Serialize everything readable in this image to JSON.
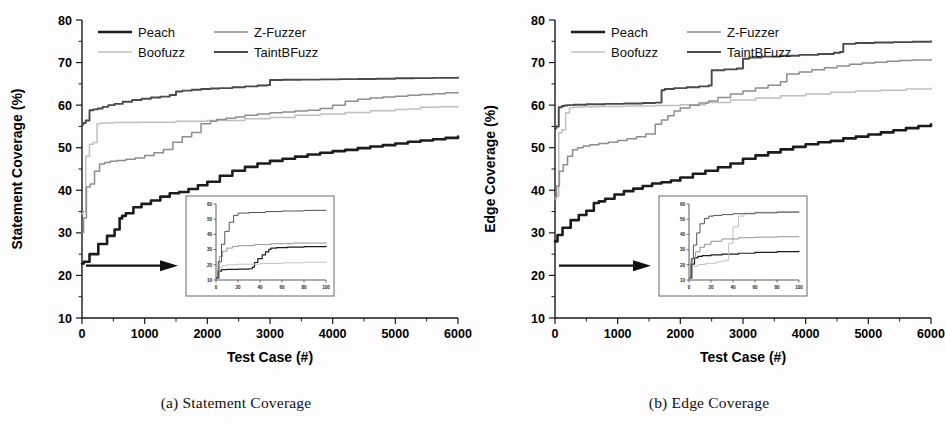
{
  "figure": {
    "panels": [
      {
        "id": "a",
        "caption": "(a) Statement Coverage",
        "ylabel": "Statement Coverage (%)",
        "xlabel": "Test Case (#)"
      },
      {
        "id": "b",
        "caption": "(b) Edge Coverage",
        "ylabel": "Edge Coverage (%)",
        "xlabel": "Test Case (#)"
      }
    ],
    "legend": {
      "entries": [
        {
          "label": "Peach",
          "color": "#1c1c1c",
          "width": 2.6
        },
        {
          "label": "Z-Fuzzer",
          "color": "#8e8e8e",
          "width": 1.5
        },
        {
          "label": "Boofuzz",
          "color": "#c0c0c0",
          "width": 1.5
        },
        {
          "label": "TaintBFuzz",
          "color": "#4a4a4a",
          "width": 1.9
        }
      ]
    }
  },
  "chart_data": [
    {
      "type": "line",
      "title": "(a) Statement Coverage",
      "xlabel": "Test Case (#)",
      "ylabel": "Statement Coverage (%)",
      "xlim": [
        0,
        6000
      ],
      "ylim": [
        10,
        80
      ],
      "xticks": [
        0,
        1000,
        2000,
        3000,
        4000,
        5000,
        6000
      ],
      "yticks": [
        10,
        20,
        30,
        40,
        50,
        60,
        70,
        80
      ],
      "grid": false,
      "legend_position": "top-left-inside",
      "annotations": [
        "arrow from y-axis near 22% pointing right to inset"
      ],
      "series": [
        {
          "name": "Peach",
          "color": "#1c1c1c",
          "x": [
            0,
            30,
            120,
            260,
            400,
            520,
            600,
            640,
            700,
            820,
            950,
            1100,
            1250,
            1400,
            1550,
            1700,
            1850,
            2000,
            2200,
            2400,
            2600,
            2800,
            3000,
            3200,
            3400,
            3600,
            3800,
            4000,
            4200,
            4400,
            4600,
            4800,
            5000,
            5200,
            5400,
            5600,
            5800,
            6000
          ],
          "y": [
            22.8,
            23.2,
            25.0,
            27.4,
            29.3,
            30.8,
            33.4,
            34.0,
            34.6,
            36.0,
            36.8,
            37.6,
            38.5,
            39.3,
            39.6,
            40.3,
            41.2,
            42.0,
            43.4,
            44.6,
            45.5,
            46.3,
            46.9,
            47.4,
            47.9,
            48.4,
            48.8,
            49.2,
            49.5,
            49.9,
            50.3,
            50.6,
            51.0,
            51.4,
            51.7,
            52.0,
            52.3,
            52.6
          ]
        },
        {
          "name": "Boofuzz",
          "color": "#c0c0c0",
          "x": [
            0,
            20,
            60,
            120,
            180,
            240,
            300,
            500,
            900,
            1500,
            2000,
            2600,
            3000,
            3400,
            3800,
            4200,
            4600,
            5000,
            5200,
            5400,
            5700,
            6000
          ],
          "y": [
            34.5,
            35.0,
            48.0,
            50.8,
            51.2,
            55.6,
            55.8,
            55.9,
            56.0,
            56.2,
            56.4,
            56.8,
            57.1,
            57.6,
            57.9,
            58.3,
            58.7,
            59.0,
            59.1,
            59.5,
            59.6,
            59.7
          ]
        },
        {
          "name": "Z-Fuzzer",
          "color": "#8e8e8e",
          "x": [
            0,
            25,
            70,
            130,
            200,
            280,
            360,
            450,
            560,
            700,
            850,
            1000,
            1150,
            1300,
            1450,
            1600,
            1750,
            1900,
            2050,
            2150,
            2300,
            2450,
            2600,
            2800,
            3000,
            3200,
            3400,
            3600,
            3800,
            4000,
            4200,
            4400,
            4600,
            4800,
            5000,
            5200,
            5400,
            5600,
            5800,
            6000
          ],
          "y": [
            30.0,
            33.5,
            40.8,
            41.5,
            44.5,
            46.2,
            46.5,
            46.8,
            47.0,
            47.3,
            47.6,
            48.2,
            48.8,
            49.6,
            51.3,
            52.6,
            53.6,
            55.6,
            56.2,
            56.6,
            56.9,
            57.2,
            57.6,
            57.9,
            58.2,
            58.4,
            58.6,
            58.8,
            59.2,
            60.0,
            60.9,
            61.4,
            61.7,
            61.9,
            62.1,
            62.3,
            62.5,
            62.7,
            62.9,
            63.0
          ]
        },
        {
          "name": "TaintBFuzz",
          "color": "#4a4a4a",
          "x": [
            0,
            20,
            60,
            120,
            180,
            250,
            330,
            420,
            520,
            650,
            800,
            950,
            1100,
            1250,
            1400,
            1500,
            1600,
            1750,
            1900,
            2050,
            2200,
            2400,
            2600,
            2800,
            2950,
            3000,
            3200,
            3500,
            3800,
            4100,
            4400,
            4700,
            5000,
            5300,
            5600,
            6000
          ],
          "y": [
            55.4,
            55.8,
            56.4,
            58.8,
            59.0,
            59.2,
            59.6,
            60.0,
            60.3,
            60.8,
            61.2,
            61.5,
            61.8,
            62.0,
            62.4,
            63.2,
            63.4,
            63.6,
            63.8,
            63.9,
            64.0,
            64.2,
            64.4,
            64.6,
            64.7,
            65.9,
            65.95,
            66.0,
            66.05,
            66.1,
            66.15,
            66.2,
            66.3,
            66.35,
            66.4,
            66.5
          ]
        }
      ],
      "inset": {
        "xlim": [
          0,
          100
        ],
        "ylim": [
          10,
          60
        ],
        "xticks": [
          0,
          20,
          40,
          60,
          80,
          100
        ],
        "yticks": [
          10,
          20,
          30,
          40,
          50,
          60
        ],
        "series": [
          {
            "name": "Peach",
            "color": "#1c1c1c",
            "x": [
              0,
              2,
              5,
              10,
              20,
              30,
              33,
              35,
              38,
              42,
              45,
              48,
              50,
              55,
              65,
              80,
              100
            ],
            "y": [
              11.5,
              15.8,
              16.8,
              17.0,
              17.2,
              17.4,
              18.5,
              21.5,
              24.0,
              26.5,
              28.5,
              30.2,
              31.0,
              31.3,
              31.6,
              32.0,
              32.5
            ]
          },
          {
            "name": "Boofuzz",
            "color": "#c0c0c0",
            "x": [
              0,
              3,
              6,
              10,
              20,
              40,
              60,
              80,
              100
            ],
            "y": [
              11.0,
              18.5,
              19.6,
              20.0,
              20.4,
              20.9,
              21.3,
              21.7,
              22.1
            ]
          },
          {
            "name": "Z-Fuzzer",
            "color": "#8e8e8e",
            "x": [
              0,
              3,
              6,
              10,
              15,
              20,
              35,
              50,
              70,
              100
            ],
            "y": [
              11.0,
              25.5,
              29.0,
              31.0,
              32.0,
              32.6,
              33.3,
              33.9,
              34.3,
              34.8
            ]
          },
          {
            "name": "TaintBFuzz",
            "color": "#4a4a4a",
            "x": [
              0,
              2,
              5,
              8,
              12,
              16,
              20,
              30,
              45,
              60,
              80,
              100
            ],
            "y": [
              11.5,
              22.0,
              33.5,
              42.0,
              48.0,
              52.5,
              54.0,
              54.4,
              55.0,
              55.4,
              55.8,
              56.2
            ]
          }
        ]
      }
    },
    {
      "type": "line",
      "title": "(b) Edge Coverage",
      "xlabel": "Test Case (#)",
      "ylabel": "Edge Coverage (%)",
      "xlim": [
        0,
        6000
      ],
      "ylim": [
        10,
        80
      ],
      "xticks": [
        0,
        1000,
        2000,
        3000,
        4000,
        5000,
        6000
      ],
      "yticks": [
        10,
        20,
        30,
        40,
        50,
        60,
        70,
        80
      ],
      "grid": false,
      "legend_position": "top-left-inside",
      "annotations": [
        "arrow from y-axis near 22% pointing right to inset"
      ],
      "series": [
        {
          "name": "Peach",
          "color": "#1c1c1c",
          "x": [
            0,
            40,
            120,
            250,
            380,
            500,
            620,
            700,
            800,
            950,
            1100,
            1250,
            1400,
            1550,
            1700,
            1850,
            2000,
            2200,
            2400,
            2600,
            2800,
            3000,
            3200,
            3400,
            3600,
            3800,
            4000,
            4200,
            4400,
            4600,
            4800,
            5000,
            5200,
            5400,
            5600,
            5800,
            6000
          ],
          "y": [
            28.0,
            29.5,
            31.2,
            33.0,
            34.2,
            35.2,
            37.0,
            37.4,
            38.0,
            39.0,
            39.8,
            40.4,
            41.0,
            41.6,
            41.9,
            42.3,
            43.0,
            43.9,
            44.6,
            45.4,
            46.3,
            47.4,
            48.2,
            48.9,
            49.6,
            50.2,
            50.8,
            51.3,
            51.6,
            52.2,
            52.6,
            53.1,
            53.6,
            54.1,
            54.6,
            55.1,
            55.5
          ]
        },
        {
          "name": "Boofuzz",
          "color": "#c0c0c0",
          "x": [
            0,
            20,
            60,
            110,
            170,
            230,
            300,
            450,
            700,
            1100,
            1600,
            2000,
            2400,
            2800,
            3200,
            3600,
            4000,
            4400,
            4800,
            5200,
            5600,
            6000
          ],
          "y": [
            38.0,
            38.6,
            53.5,
            54.2,
            58.2,
            59.4,
            59.5,
            59.6,
            59.7,
            59.8,
            59.9,
            60.1,
            60.6,
            61.2,
            61.7,
            62.2,
            62.6,
            63.0,
            63.3,
            63.5,
            63.8,
            64.0
          ]
        },
        {
          "name": "Z-Fuzzer",
          "color": "#8e8e8e",
          "x": [
            0,
            25,
            70,
            130,
            200,
            280,
            360,
            450,
            560,
            700,
            850,
            1000,
            1150,
            1300,
            1450,
            1600,
            1700,
            1800,
            1900,
            2000,
            2150,
            2300,
            2450,
            2600,
            2800,
            3000,
            3200,
            3400,
            3600,
            3700,
            3900,
            4100,
            4300,
            4500,
            4700,
            4900,
            5100,
            5300,
            5500,
            5700,
            6000
          ],
          "y": [
            38.5,
            41.0,
            44.5,
            46.0,
            48.0,
            49.5,
            50.0,
            50.4,
            50.7,
            51.0,
            51.3,
            51.7,
            52.1,
            52.6,
            53.2,
            55.5,
            56.5,
            57.5,
            58.6,
            59.3,
            60.0,
            60.5,
            61.0,
            61.8,
            62.6,
            63.3,
            64.0,
            64.7,
            65.5,
            67.3,
            67.8,
            68.3,
            68.8,
            69.2,
            69.6,
            69.9,
            70.1,
            70.3,
            70.5,
            70.6,
            70.8
          ]
        },
        {
          "name": "TaintBFuzz",
          "color": "#4a4a4a",
          "x": [
            0,
            20,
            60,
            110,
            150,
            200,
            300,
            500,
            800,
            1100,
            1400,
            1600,
            1700,
            1750,
            1900,
            2100,
            2300,
            2450,
            2500,
            2700,
            2900,
            3000,
            3100,
            3300,
            3600,
            3900,
            4200,
            4450,
            4550,
            4600,
            4800,
            5100,
            5400,
            5700,
            6000
          ],
          "y": [
            54.5,
            55.0,
            59.5,
            59.8,
            59.9,
            60.0,
            60.1,
            60.2,
            60.3,
            60.4,
            60.5,
            60.6,
            63.5,
            63.8,
            64.0,
            64.2,
            64.4,
            64.6,
            68.2,
            68.4,
            68.6,
            70.9,
            71.2,
            71.4,
            71.6,
            71.8,
            72.0,
            72.3,
            72.5,
            74.4,
            74.6,
            74.7,
            74.8,
            74.9,
            75.0
          ]
        }
      ],
      "inset": {
        "xlim": [
          0,
          100
        ],
        "ylim": [
          10,
          60
        ],
        "xticks": [
          0,
          20,
          40,
          60,
          80,
          100
        ],
        "yticks": [
          10,
          20,
          30,
          40,
          50,
          60
        ],
        "series": [
          {
            "name": "Peach",
            "color": "#1c1c1c",
            "x": [
              0,
              2,
              5,
              8,
              12,
              20,
              30,
              45,
              60,
              80,
              100
            ],
            "y": [
              11.0,
              20.5,
              24.5,
              25.5,
              26.0,
              26.5,
              27.0,
              27.6,
              28.2,
              28.7,
              29.2
            ]
          },
          {
            "name": "Boofuzz",
            "color": "#c0c0c0",
            "x": [
              0,
              3,
              8,
              15,
              25,
              32,
              36,
              40,
              45,
              50,
              60,
              80,
              100
            ],
            "y": [
              11.0,
              19.0,
              20.2,
              21.0,
              22.0,
              23.0,
              34.0,
              45.0,
              52.0,
              54.0,
              54.6,
              55.0,
              55.3
            ]
          },
          {
            "name": "Z-Fuzzer",
            "color": "#8e8e8e",
            "x": [
              0,
              3,
              6,
              10,
              14,
              20,
              30,
              45,
              60,
              80,
              100
            ],
            "y": [
              11.0,
              24.0,
              28.5,
              31.5,
              33.5,
              35.5,
              37.0,
              37.8,
              38.2,
              38.5,
              38.8
            ]
          },
          {
            "name": "TaintBFuzz",
            "color": "#4a4a4a",
            "x": [
              0,
              2,
              4,
              7,
              10,
              14,
              18,
              22,
              30,
              40,
              60,
              80,
              100
            ],
            "y": [
              11.5,
              24.0,
              33.0,
              41.0,
              47.0,
              50.5,
              52.0,
              52.5,
              53.0,
              53.6,
              54.2,
              54.6,
              55.0
            ]
          }
        ]
      }
    }
  ]
}
